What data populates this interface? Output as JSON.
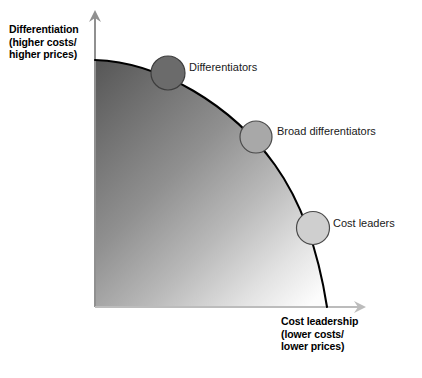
{
  "figure": {
    "type": "strategic-positioning-frontier-diagram",
    "background_color": "#ffffff"
  },
  "axes": {
    "y": {
      "name": "differentiation-axis",
      "line1": "Differentiation",
      "line2": "(higher costs/",
      "line3": "higher prices)",
      "direction": "up",
      "color": "#8c8c8c"
    },
    "x": {
      "name": "cost-leadership-axis",
      "line1": "Cost leadership",
      "line2": "(lower costs/",
      "line3": "lower prices)",
      "direction": "right",
      "color": "#b3b3b3"
    }
  },
  "curve": {
    "name": "productivity-frontier-curve",
    "color": "#000000",
    "stroke_width": 2,
    "shape": "concave-quarter-arc"
  },
  "fill": {
    "name": "gradient-region",
    "gradient_from": "#5e5e5e",
    "gradient_to": "#fdfdfd",
    "direction": "top-left to bottom-right"
  },
  "nodes": [
    {
      "id": "differentiators",
      "label": "Differentiators",
      "fill": "#6b6b6b",
      "stroke": "#3b3b3b",
      "cx": 168,
      "cy": 73,
      "r": 17
    },
    {
      "id": "broad-differentiators",
      "label": "Broad differentiators",
      "fill": "#a8a8a8",
      "stroke": "#4a4a4a",
      "cx": 256,
      "cy": 137,
      "r": 16
    },
    {
      "id": "cost-leaders",
      "label": "Cost leaders",
      "fill": "#cfcfcf",
      "stroke": "#4a4a4a",
      "cx": 313,
      "cy": 228,
      "r": 16.5
    }
  ]
}
